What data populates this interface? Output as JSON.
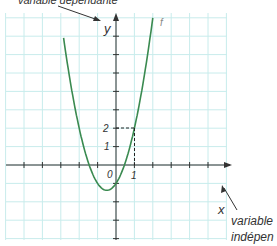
{
  "annotations": {
    "top": "variable dépendante",
    "bottom_line1": "variable",
    "bottom_line2": "indépen"
  },
  "axis": {
    "x_label": "x",
    "y_label": "y",
    "origin": "0",
    "x_tick": "1",
    "y_ticks": [
      "1",
      "2"
    ],
    "function_label": "f"
  },
  "colors": {
    "grid": "#c8ecec",
    "curve": "#3a8a50",
    "axis": "#333333"
  },
  "chart_data": {
    "type": "line",
    "title": "",
    "xlabel": "x",
    "ylabel": "y",
    "series": [
      {
        "name": "f",
        "function": "f(x) = 1.5x^2 + 1.5x - 1",
        "points": [
          [
            -2,
            2
          ],
          [
            -1.5,
            0.125
          ],
          [
            -1,
            -1
          ],
          [
            -0.5,
            -1.375
          ],
          [
            0,
            -1
          ],
          [
            0.5,
            0.125
          ],
          [
            1,
            2
          ],
          [
            1.5,
            4.625
          ]
        ]
      }
    ],
    "highlighted_point": {
      "x": 1,
      "y": 2
    },
    "xlim": [
      -6,
      6
    ],
    "ylim": [
      -4,
      8.3
    ],
    "grid": true,
    "annotations": [
      "variable dépendante → y",
      "variable indépen(dante) → x"
    ]
  }
}
